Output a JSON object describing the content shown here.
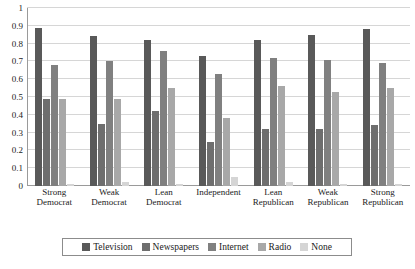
{
  "chart_data": {
    "type": "bar",
    "title": "",
    "xlabel": "",
    "ylabel": "",
    "ylim": [
      0,
      1
    ],
    "yticks": [
      "0",
      "0.1",
      "0.2",
      "0.3",
      "0.4",
      "0.5",
      "0.6",
      "0.7",
      "0.8",
      "0.9",
      "1"
    ],
    "grid": "horizontal",
    "legend_position": "bottom",
    "categories": [
      "Strong Democrat",
      "Weak Democrat",
      "Lean Democrat",
      "Independent",
      "Lean Republican",
      "Weak Republican",
      "Strong Republican"
    ],
    "category_lines": [
      [
        "Strong",
        "Democrat"
      ],
      [
        "Weak",
        "Democrat"
      ],
      [
        "Lean",
        "Democrat"
      ],
      [
        "Independent",
        ""
      ],
      [
        "Lean",
        "Republican"
      ],
      [
        "Weak",
        "Republican"
      ],
      [
        "Strong",
        "Republican"
      ]
    ],
    "series": [
      {
        "name": "Television",
        "color": "#595959",
        "values": [
          0.89,
          0.84,
          0.82,
          0.73,
          0.82,
          0.85,
          0.88
        ]
      },
      {
        "name": "Newspapers",
        "color": "#6e6e6e",
        "values": [
          0.49,
          0.35,
          0.42,
          0.25,
          0.32,
          0.32,
          0.34
        ]
      },
      {
        "name": "Internet",
        "color": "#808080",
        "values": [
          0.68,
          0.7,
          0.76,
          0.63,
          0.72,
          0.71,
          0.69
        ]
      },
      {
        "name": "Radio",
        "color": "#a8a8a8",
        "values": [
          0.49,
          0.49,
          0.55,
          0.38,
          0.56,
          0.53,
          0.55
        ]
      },
      {
        "name": "None",
        "color": "#d5d5d5",
        "values": [
          0.01,
          0.02,
          0.01,
          0.05,
          0.02,
          0.01,
          0.01
        ]
      }
    ]
  }
}
